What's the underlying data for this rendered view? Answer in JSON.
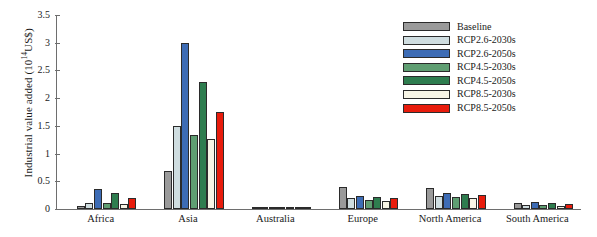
{
  "chart_data": {
    "type": "bar",
    "title": "",
    "xlabel": "",
    "ylabel": "Industrial value added (10^14 US$)",
    "ylabel_prefix": "Industrial value added (10",
    "ylabel_exponent": "14",
    "ylabel_suffix": "US$)",
    "ylim": [
      0,
      3.5
    ],
    "yticks": [
      0,
      0.5,
      1,
      1.5,
      2,
      2.5,
      3,
      3.5
    ],
    "ytick_labels": [
      "0",
      "0.5",
      "1",
      "1.5",
      "2",
      "2.5",
      "3",
      "3.5"
    ],
    "grid": false,
    "legend_position": "top-right",
    "categories": [
      "Africa",
      "Asia",
      "Australia",
      "Europe",
      "North America",
      "South America"
    ],
    "series": [
      {
        "name": "Baseline",
        "color": "#9a9a9a",
        "values": [
          0.05,
          0.69,
          0.02,
          0.4,
          0.38,
          0.1
        ]
      },
      {
        "name": "RCP2.6-2030s",
        "color": "#cfdde0",
        "values": [
          0.11,
          1.49,
          0.01,
          0.19,
          0.23,
          0.07
        ]
      },
      {
        "name": "RCP2.6-2050s",
        "color": "#3d6cb5",
        "values": [
          0.36,
          2.99,
          0.01,
          0.24,
          0.28,
          0.13
        ]
      },
      {
        "name": "RCP4.5-2030s",
        "color": "#5f9e72",
        "values": [
          0.1,
          1.34,
          0.01,
          0.17,
          0.22,
          0.07
        ]
      },
      {
        "name": "RCP4.5-2050s",
        "color": "#2e7d4f",
        "values": [
          0.28,
          2.29,
          0.01,
          0.22,
          0.27,
          0.11
        ]
      },
      {
        "name": "RCP8.5-2030s",
        "color": "#f7f5e6",
        "values": [
          0.09,
          1.26,
          0.01,
          0.15,
          0.2,
          0.06
        ]
      },
      {
        "name": "RCP8.5-2050s",
        "color": "#e81c0c",
        "values": [
          0.19,
          1.75,
          0.01,
          0.2,
          0.25,
          0.09
        ]
      }
    ]
  }
}
